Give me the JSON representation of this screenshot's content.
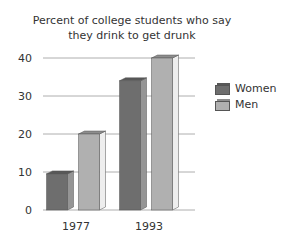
{
  "chart_data": {
    "type": "bar",
    "title": "Percent of college students who say they drink to get drunk",
    "title_lines": [
      "Percent of college students who say",
      "they drink to get drunk"
    ],
    "categories": [
      "1977",
      "1993"
    ],
    "series": [
      {
        "name": "Women",
        "values": [
          9.5,
          34
        ],
        "color": "#6e6e6e"
      },
      {
        "name": "Men",
        "values": [
          20,
          40
        ],
        "color": "#b0b0b0"
      }
    ],
    "xlabel": "",
    "ylabel": "",
    "ylim": [
      0,
      40
    ],
    "yticks": [
      0,
      10,
      20,
      30,
      40
    ],
    "grid": true,
    "legend_position": "right",
    "style": "3d-bar"
  }
}
